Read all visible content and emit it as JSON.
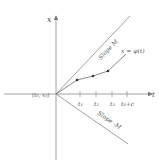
{
  "diagram": {
    "axes": {
      "vertical_label": "x",
      "horizontal_label": "t",
      "origin_label": "(t₀, x₀)"
    },
    "lines": {
      "upper_label": "Slope M",
      "lower_label": "Slope -M"
    },
    "curve_label": "x = φ(t)",
    "ticks": [
      "t₁",
      "t₂",
      "t₃",
      "t₀+c"
    ],
    "colors": {
      "line": "#7a7a7a",
      "text": "#555555",
      "dot": "#333333"
    }
  }
}
